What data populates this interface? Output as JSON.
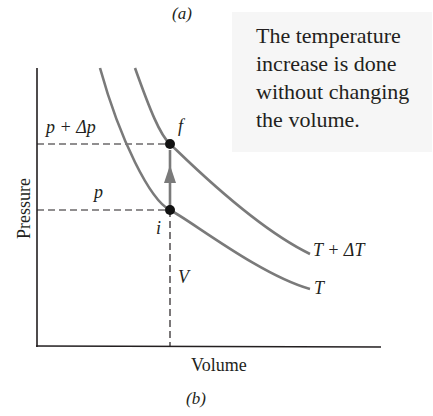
{
  "figure": {
    "caption_top": "(a)",
    "caption_bottom": "(b)",
    "note": "The temperature increase is done without changing the volume.",
    "note_lines": [
      "The temperature",
      "increase is done",
      "without changing",
      "the volume."
    ],
    "axes": {
      "x_label": "Volume",
      "y_label": "Pressure"
    },
    "labels": {
      "p_plus_dp": "p + Δp",
      "p": "p",
      "V": "V",
      "point_i": "i",
      "point_f": "f",
      "isotherm_high": "T + ΔT",
      "isotherm_low": "T"
    },
    "colors": {
      "curve": "#7a7a7a",
      "axis": "#231f20",
      "point": "#111111",
      "arrow": "#7a7a7a",
      "note_bg": "#f6f6f6"
    }
  }
}
